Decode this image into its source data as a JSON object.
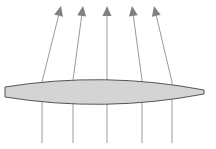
{
  "diagram": {
    "type": "converging-lens-ray-diagram",
    "colors": {
      "background": "#ffffff",
      "lens_fill": "#d4d4d4",
      "lens_stroke": "#555555",
      "ray": "#9a9a9a",
      "arrowhead": "#808080"
    },
    "lens": {
      "left_x": 5,
      "right_x": 204,
      "edge_top_y": 87,
      "edge_bottom_y": 97,
      "top_center_y": 79,
      "bottom_center_y": 105
    },
    "rays": [
      {
        "x_bottom": 42,
        "y_bottom": 143,
        "x_lens": 42,
        "y_lens": 82,
        "x_tip": 61,
        "y_tip": 6
      },
      {
        "x_bottom": 73,
        "y_bottom": 143,
        "x_lens": 73,
        "y_lens": 80,
        "x_tip": 83,
        "y_tip": 6
      },
      {
        "x_bottom": 107,
        "y_bottom": 143,
        "x_lens": 107,
        "y_lens": 79,
        "x_tip": 107,
        "y_tip": 6
      },
      {
        "x_bottom": 142,
        "y_bottom": 143,
        "x_lens": 142,
        "y_lens": 80,
        "x_tip": 132,
        "y_tip": 6
      },
      {
        "x_bottom": 172,
        "y_bottom": 143,
        "x_lens": 172,
        "y_lens": 82,
        "x_tip": 154,
        "y_tip": 6
      }
    ]
  }
}
